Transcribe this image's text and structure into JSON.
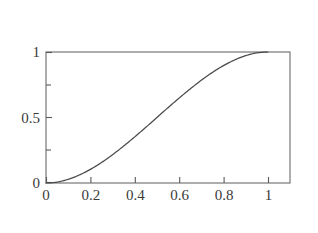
{
  "figure": {
    "title": "F(x)",
    "title_parts": {
      "func": "F",
      "open": "(",
      "var": "x",
      "close": ")"
    },
    "background_color": "#ffffff",
    "frame_color": "#808080",
    "axis_color": "#555555",
    "curve_color": "#4a4a4a",
    "text_color": "#3a3a3a"
  },
  "chart_data": {
    "type": "line",
    "title": "F(x)",
    "xlabel": "",
    "ylabel": "",
    "xlim": [
      0,
      1.1
    ],
    "ylim": [
      0,
      1
    ],
    "grid": false,
    "legend": null,
    "xticks": [
      0,
      0.2,
      0.4,
      0.6,
      0.8,
      1
    ],
    "xtick_labels": [
      "0",
      "0.2",
      "0.4",
      "0.6",
      "0.8",
      "1"
    ],
    "yticks": [
      0,
      0.5,
      1
    ],
    "ytick_labels": [
      "0",
      "0.5",
      "1"
    ],
    "yticks_minor": [
      0.25,
      0.75
    ],
    "series": [
      {
        "name": "F(x)",
        "x": [
          0.0,
          0.05,
          0.1,
          0.15,
          0.2,
          0.25,
          0.3,
          0.35,
          0.4,
          0.45,
          0.5,
          0.55,
          0.6,
          0.65,
          0.7,
          0.75,
          0.8,
          0.85,
          0.9,
          0.95,
          1.0
        ],
        "y": [
          0.0,
          0.007,
          0.028,
          0.061,
          0.104,
          0.156,
          0.216,
          0.282,
          0.352,
          0.425,
          0.5,
          0.575,
          0.648,
          0.718,
          0.784,
          0.844,
          0.896,
          0.939,
          0.972,
          0.993,
          1.0
        ]
      }
    ]
  },
  "axes": {
    "x_tick_labels": [
      "0",
      "0.2",
      "0.4",
      "0.6",
      "0.8",
      "1"
    ],
    "y_tick_labels": [
      "1",
      "0.5",
      "0"
    ]
  }
}
